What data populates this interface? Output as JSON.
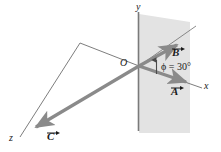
{
  "figure": {
    "background_color": "#ffffff",
    "plane_fill": "#e3e3e3",
    "vector_color": "#8a8a8a",
    "axis_color": "#6e6e6e",
    "text_color": "#1a1a1a"
  },
  "axes": {
    "x_label": "x",
    "y_label": "y",
    "z_label": "z",
    "origin_label": "O"
  },
  "vectors": [
    {
      "id": "A",
      "label": "A",
      "direction": "down-right along x",
      "color": "#8a8a8a"
    },
    {
      "id": "B",
      "label": "B",
      "direction": "up-right at 30 degrees above A",
      "color": "#8a8a8a"
    },
    {
      "id": "C",
      "label": "C",
      "direction": "down-left along z",
      "color": "#8a8a8a"
    }
  ],
  "annotations": {
    "angle_label": "ϕ = 30°",
    "angle_symbol": "ϕ",
    "angle_value": "30°"
  }
}
